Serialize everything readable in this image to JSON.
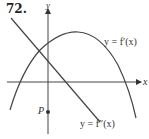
{
  "problem_number": "72.",
  "axes": {
    "x_label": "x",
    "y_label": "y"
  },
  "curves": {
    "first_derivative_label": "y = f′(x)",
    "second_derivative_label": "y = f″(x)"
  },
  "point": {
    "label": "P"
  },
  "colors": {
    "ink": "#333333",
    "background": "#ffffff"
  }
}
